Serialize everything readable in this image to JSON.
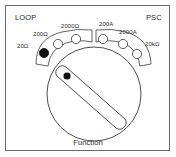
{
  "panel": {
    "corner_left_label": "LOOP",
    "corner_right_label": "PSC",
    "caption": "Function",
    "border_color": "#6b6b6b",
    "background": "#ffffff",
    "line_color": "#3a3a3a"
  },
  "dial": {
    "name": "function-selector-knob",
    "center_x": 88,
    "center_y": 88,
    "radius": 47,
    "pointer": {
      "angle_deg": 225,
      "fill": "#ffffff",
      "stroke": "#3a3a3a",
      "marker_fill": "#111111"
    },
    "selected_position": "20Ω"
  },
  "positions": [
    {
      "label": "20Ω",
      "name": "position-20-ohm",
      "selected": true,
      "x": 38,
      "y": 47
    },
    {
      "label": "200Ω",
      "name": "position-200-ohm",
      "selected": false,
      "x": 52,
      "y": 38
    },
    {
      "label": "2000Ω",
      "name": "position-2000-ohm",
      "selected": false,
      "x": 70,
      "y": 33
    },
    {
      "label": "200A",
      "name": "position-200-a",
      "selected": false,
      "x": 97,
      "y": 33
    },
    {
      "label": "2000A",
      "name": "position-2000-a",
      "selected": false,
      "x": 117,
      "y": 38
    },
    {
      "label": "20kΩ",
      "name": "position-20k-ohm",
      "selected": false,
      "x": 131,
      "y": 48
    }
  ]
}
